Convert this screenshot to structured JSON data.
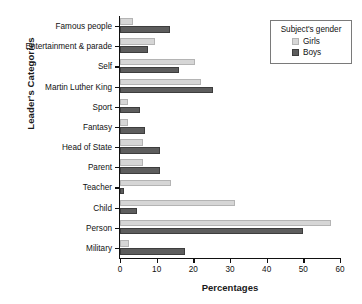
{
  "chart_data": {
    "type": "bar",
    "orientation": "horizontal",
    "title": "",
    "xlabel": "Percentages",
    "ylabel": "Leader's Categories",
    "xlim": [
      0,
      60
    ],
    "xticks": [
      0,
      10,
      20,
      30,
      40,
      50,
      60
    ],
    "grid": false,
    "legend_position": "top-right",
    "legend_title": "Subject's gender",
    "categories": [
      "Famous people",
      "Entertainment & parade",
      "Self",
      "Martin Luther King",
      "Sport",
      "Fantasy",
      "Head of State",
      "Parent",
      "Teacher",
      "Child",
      "Person",
      "Military"
    ],
    "series": [
      {
        "name": "Girls",
        "color": "#d6d6d6",
        "values": [
          3.5,
          9.5,
          20.5,
          22.0,
          2.3,
          2.3,
          6.3,
          6.3,
          14.0,
          31.4,
          57.5,
          2.4
        ]
      },
      {
        "name": "Boys",
        "color": "#5d5d5d",
        "values": [
          13.6,
          7.6,
          16.0,
          25.4,
          5.5,
          6.8,
          11.0,
          10.8,
          1.2,
          4.5,
          50.0,
          17.8
        ]
      }
    ]
  },
  "legend": {
    "title": "Subject's gender",
    "items": [
      {
        "label": "Girls",
        "color": "#d6d6d6"
      },
      {
        "label": "Boys",
        "color": "#5d5d5d"
      }
    ]
  },
  "axes": {
    "x_title": "Percentages",
    "y_title": "Leader's Categories",
    "x_tick_labels": [
      "0",
      "10",
      "20",
      "30",
      "40",
      "50",
      "60"
    ]
  }
}
